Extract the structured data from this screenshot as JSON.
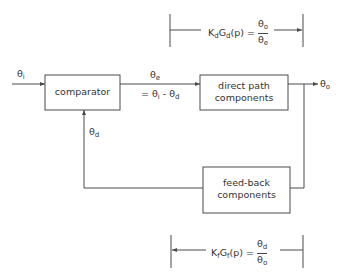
{
  "diagram": {
    "type": "feedback-control-block-diagram",
    "blocks": {
      "comparator": {
        "label": "comparator"
      },
      "direct_path": {
        "label_line1": "direct path",
        "label_line2": "components"
      },
      "feedback": {
        "label_line1": "feed-back",
        "label_line2": "components"
      }
    },
    "signals": {
      "input": {
        "symbol": "θ",
        "sub": "i"
      },
      "error": {
        "symbol": "θ",
        "sub": "e"
      },
      "error_def": {
        "prefix": "= θ",
        "sub1": "i",
        "mid": " - θ",
        "sub2": "d"
      },
      "output": {
        "symbol": "θ",
        "sub": "o"
      },
      "feedback": {
        "symbol": "θ",
        "sub": "d"
      }
    },
    "formulas": {
      "direct": {
        "K": "K",
        "K_sub": "d",
        "G": "G",
        "G_sub": "d",
        "arg": "(p) =",
        "num": "θ",
        "num_sub": "o",
        "den": "θ",
        "den_sub": "e",
        "arrow_direction": "right"
      },
      "feedback": {
        "K": "K",
        "K_sub": "f",
        "G": "G",
        "G_sub": "f",
        "arg": "(p) =",
        "num": "θ",
        "num_sub": "d",
        "den": "θ",
        "den_sub": "o",
        "arrow_direction": "left"
      }
    },
    "colors": {
      "line": "#4a4a4a",
      "background": "#ffffff"
    }
  }
}
